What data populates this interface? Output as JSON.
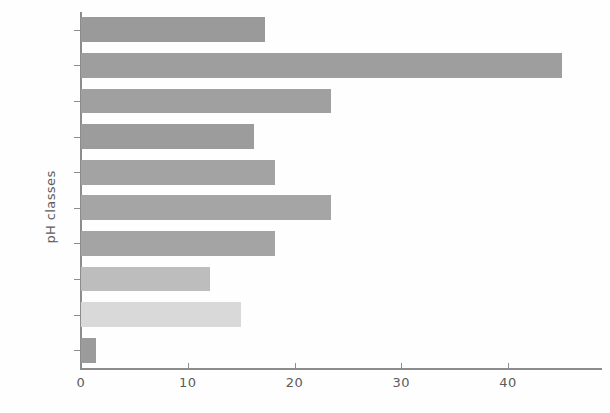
{
  "chart_data": {
    "type": "bar",
    "orientation": "horizontal",
    "title": "",
    "subtitle": "",
    "xlabel": "",
    "ylabel": "pH classes",
    "categories": [
      ">7.6",
      "7.1–7.5",
      "6.6–7.0",
      "6.1–6.5",
      "5.6–6.0",
      "5.1–5.5",
      "4.6–5.0",
      "4.1–4.5",
      "3.6–4.0",
      "<3.6"
    ],
    "values": [
      17.2,
      45.1,
      23.4,
      16.2,
      18.2,
      23.4,
      18.2,
      12.1,
      15.0,
      1.4
    ],
    "bar_colors": [
      "#9a9a9a",
      "#9e9e9e",
      "#a0a0a0",
      "#9c9c9c",
      "#a3a3a3",
      "#a5a5a5",
      "#a4a4a4",
      "#bdbdbd",
      "#d9d9d9",
      "#9b9b9b"
    ],
    "xlim": [
      0,
      48.8
    ],
    "ylim": [
      0,
      10
    ],
    "xticks": [
      0,
      10,
      20,
      30,
      40
    ],
    "xtick_labels": [
      "0",
      "10",
      "20",
      "30",
      "40"
    ],
    "grid": false,
    "legend": false,
    "legend_position": "none"
  },
  "axes": {
    "axis_color": "#8c8c8c",
    "tick_label_color": "#5b5b5b"
  }
}
